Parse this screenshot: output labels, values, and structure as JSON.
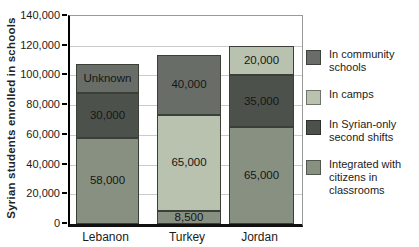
{
  "figure": {
    "background": "#ffffff",
    "ylabel": "Syrian students enrolled in schools"
  },
  "chart_data": {
    "type": "bar",
    "stacked": true,
    "title": "",
    "xlabel": "",
    "ylabel": "Syrian students enrolled in schools",
    "ylim": [
      0,
      140000
    ],
    "ytick_step": 20000,
    "grid": true,
    "legend_position": "right",
    "categories": [
      "Lebanon",
      "Turkey",
      "Jordan"
    ],
    "series": [
      {
        "name": "Integrated with citizens in classrooms",
        "key": "integrated",
        "values": [
          58000,
          8500,
          65000
        ],
        "value_labels": [
          "58,000",
          "8,500",
          "65,000"
        ]
      },
      {
        "name": "In Syrian-only second shifts",
        "key": "syrian_only",
        "values": [
          30000,
          null,
          35000
        ],
        "value_labels": [
          "30,000",
          null,
          "35,000"
        ]
      },
      {
        "name": "In camps",
        "key": "camps",
        "values": [
          null,
          65000,
          20000
        ],
        "value_labels": [
          null,
          "65,000",
          "20,000"
        ]
      },
      {
        "name": "In community schools",
        "key": "community",
        "values": [
          20000,
          40000,
          null
        ],
        "value_labels": [
          "Unknown",
          "40,000",
          null
        ]
      }
    ],
    "bar_totals_estimated": [
      108000,
      113500,
      120000
    ]
  },
  "legend": {
    "items": [
      {
        "label": "In community schools",
        "key": "community"
      },
      {
        "label": "In camps",
        "key": "camps"
      },
      {
        "label": "In Syrian-only second shifts",
        "key": "syrian_only"
      },
      {
        "label": "Integrated with citizens in classrooms",
        "key": "integrated"
      }
    ]
  },
  "colors": {
    "community": "#686e67",
    "camps": "#b8c2af",
    "syrian_only": "#4c524b",
    "integrated": "#889082",
    "segment_border": "#3a3f38",
    "gridline": "#cbcbcb",
    "axis": "#000000",
    "text": "#1b1b1b"
  },
  "layout_px": {
    "plot": {
      "left": 68,
      "top": 15,
      "width": 232,
      "height": 208
    },
    "bar_lefts": [
      6,
      87,
      159
    ],
    "bar_widths": [
      63,
      64,
      65
    ]
  }
}
